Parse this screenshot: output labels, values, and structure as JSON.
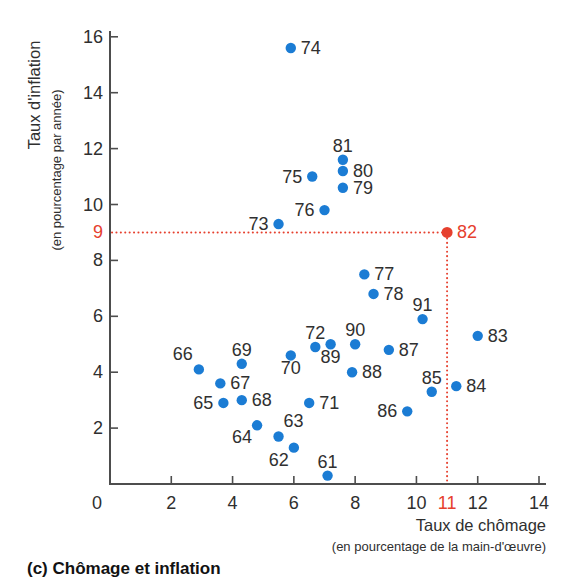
{
  "caption": "(c) Chômage et inflation",
  "chart_data": {
    "type": "scatter",
    "title": "",
    "xlabel": "Taux de chômage",
    "xlabel_sub": "(en pourcentage de la main-d'œuvre)",
    "ylabel": "Taux d'inflation",
    "ylabel_sub": "(en pourcentage par année)",
    "xlim": [
      0,
      14
    ],
    "ylim": [
      0,
      16
    ],
    "x_ticks": [
      0,
      2,
      4,
      6,
      8,
      10,
      12,
      14
    ],
    "y_ticks": [
      2,
      4,
      6,
      8,
      10,
      12,
      14,
      16
    ],
    "grid": false,
    "legend": "none",
    "highlight": {
      "year": "82",
      "x": 11,
      "y": 9,
      "x_axis_label": "11",
      "y_axis_label": "9",
      "dotted_guides": true
    },
    "points": [
      {
        "year": "61",
        "x": 7.1,
        "y": 0.3,
        "label_pos": "above"
      },
      {
        "year": "62",
        "x": 6.0,
        "y": 1.3,
        "label_pos": "below-left"
      },
      {
        "year": "63",
        "x": 5.5,
        "y": 1.7,
        "label_pos": "above-right"
      },
      {
        "year": "64",
        "x": 4.8,
        "y": 2.1,
        "label_pos": "below-left"
      },
      {
        "year": "65",
        "x": 3.7,
        "y": 2.9,
        "label_pos": "left"
      },
      {
        "year": "66",
        "x": 2.9,
        "y": 4.1,
        "label_pos": "above-left"
      },
      {
        "year": "67",
        "x": 3.6,
        "y": 3.6,
        "label_pos": "right"
      },
      {
        "year": "68",
        "x": 4.3,
        "y": 3.0,
        "label_pos": "right"
      },
      {
        "year": "69",
        "x": 4.3,
        "y": 4.3,
        "label_pos": "above"
      },
      {
        "year": "70",
        "x": 5.9,
        "y": 4.6,
        "label_pos": "below"
      },
      {
        "year": "71",
        "x": 6.5,
        "y": 2.9,
        "label_pos": "right"
      },
      {
        "year": "72",
        "x": 6.7,
        "y": 4.9,
        "label_pos": "above"
      },
      {
        "year": "73",
        "x": 5.5,
        "y": 9.3,
        "label_pos": "left"
      },
      {
        "year": "74",
        "x": 5.9,
        "y": 15.6,
        "label_pos": "right"
      },
      {
        "year": "75",
        "x": 6.6,
        "y": 11.0,
        "label_pos": "left"
      },
      {
        "year": "76",
        "x": 7.0,
        "y": 9.8,
        "label_pos": "left"
      },
      {
        "year": "77",
        "x": 8.3,
        "y": 7.5,
        "label_pos": "right"
      },
      {
        "year": "78",
        "x": 8.6,
        "y": 6.8,
        "label_pos": "right"
      },
      {
        "year": "79",
        "x": 7.6,
        "y": 10.6,
        "label_pos": "right"
      },
      {
        "year": "80",
        "x": 7.6,
        "y": 11.2,
        "label_pos": "right"
      },
      {
        "year": "81",
        "x": 7.6,
        "y": 11.6,
        "label_pos": "above"
      },
      {
        "year": "82",
        "x": 11.0,
        "y": 9.0,
        "label_pos": "right",
        "highlight": true
      },
      {
        "year": "83",
        "x": 12.0,
        "y": 5.3,
        "label_pos": "right"
      },
      {
        "year": "84",
        "x": 11.3,
        "y": 3.5,
        "label_pos": "right"
      },
      {
        "year": "85",
        "x": 10.5,
        "y": 3.3,
        "label_pos": "above"
      },
      {
        "year": "86",
        "x": 9.7,
        "y": 2.6,
        "label_pos": "left"
      },
      {
        "year": "87",
        "x": 9.1,
        "y": 4.8,
        "label_pos": "right"
      },
      {
        "year": "88",
        "x": 7.9,
        "y": 4.0,
        "label_pos": "right"
      },
      {
        "year": "89",
        "x": 7.2,
        "y": 5.0,
        "label_pos": "below"
      },
      {
        "year": "90",
        "x": 8.0,
        "y": 5.0,
        "label_pos": "above"
      },
      {
        "year": "91",
        "x": 10.2,
        "y": 5.9,
        "label_pos": "above"
      }
    ],
    "colors": {
      "point": "#1b7cd4",
      "highlight": "#e6402e",
      "axis": "#4d4d4d",
      "tick_text": "#2f2f2f",
      "point_label": "#303030",
      "caption_text": "#121212"
    }
  }
}
